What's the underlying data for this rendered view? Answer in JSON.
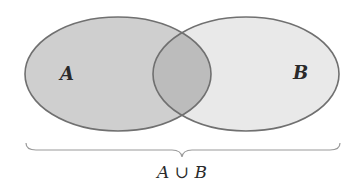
{
  "diagram": {
    "type": "venn",
    "sets": [
      {
        "id": "A",
        "label": "A",
        "fill": "#cfcfcf",
        "stroke": "#707070",
        "cx": 118,
        "cy": 74,
        "rx": 93,
        "ry": 57
      },
      {
        "id": "B",
        "label": "B",
        "fill": "#e9e9e9",
        "stroke": "#707070",
        "cx": 246,
        "cy": 74,
        "rx": 93,
        "ry": 57
      }
    ],
    "intersection_fill": "#bcbcbc",
    "brace": {
      "x_start": 25,
      "x_end": 340,
      "y": 146,
      "tip_x": 182,
      "color": "#9a9a9a"
    },
    "union_label": "A ∪ B"
  }
}
